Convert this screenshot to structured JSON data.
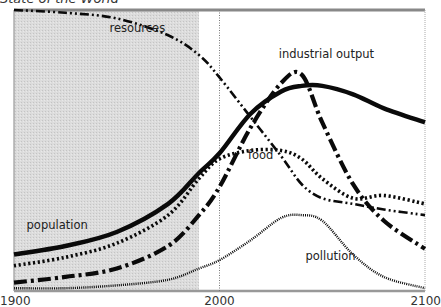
{
  "title": "State of the World",
  "chart_data": {
    "type": "line",
    "title": "State of the World",
    "xlabel": "",
    "ylabel": "",
    "xlim": [
      1900,
      2100
    ],
    "ylim": [
      0,
      100
    ],
    "x_ticks": [
      "1900",
      "2000",
      "2100"
    ],
    "grid": false,
    "shaded_region": {
      "from": 1900,
      "to": 1990,
      "meaning": "historical period"
    },
    "reference_line": 2000,
    "x": [
      1900,
      1925,
      1950,
      1975,
      1990,
      2000,
      2015,
      2030,
      2040,
      2050,
      2065,
      2080,
      2100
    ],
    "series": [
      {
        "name": "resources",
        "label": "resources",
        "style": "dash-dot-dot",
        "values": [
          100,
          99,
          97,
          91,
          84,
          76,
          62,
          48,
          38,
          33,
          31,
          29,
          27
        ]
      },
      {
        "name": "industrial output",
        "label": "industrial output",
        "style": "dash-dot-heavy",
        "values": [
          3,
          5,
          8,
          16,
          27,
          37,
          58,
          74,
          77,
          60,
          38,
          25,
          15
        ]
      },
      {
        "name": "population",
        "label": "population",
        "style": "solid-heavy",
        "values": [
          13,
          16,
          21,
          31,
          42,
          49,
          63,
          71,
          73,
          73,
          70,
          65,
          60
        ]
      },
      {
        "name": "food",
        "label": "food",
        "style": "dotted-heavy",
        "values": [
          9,
          12,
          17,
          27,
          40,
          47,
          50,
          50,
          47,
          40,
          33,
          34,
          31
        ]
      },
      {
        "name": "pollution",
        "label": "pollution",
        "style": "dotted-fine",
        "values": [
          1,
          1,
          2,
          4,
          8,
          11,
          18,
          26,
          27,
          25,
          13,
          5,
          1
        ]
      }
    ],
    "annotations": [
      {
        "text": "resources",
        "x": 1960,
        "y": 92
      },
      {
        "text": "industrial output",
        "x": 2052,
        "y": 83
      },
      {
        "text": "food",
        "x": 2020,
        "y": 47
      },
      {
        "text": "population",
        "x": 1921,
        "y": 22
      },
      {
        "text": "pollution",
        "x": 2054,
        "y": 11
      }
    ]
  }
}
